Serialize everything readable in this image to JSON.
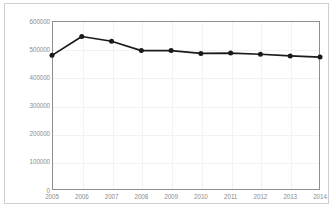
{
  "chart_data": {
    "type": "line",
    "title": "",
    "subtitle": "",
    "xlabel": "",
    "ylabel": "",
    "categories": [
      "2005",
      "2006",
      "2007",
      "2008",
      "2009",
      "2010",
      "2011",
      "2012",
      "2013",
      "2014"
    ],
    "x": [
      2005,
      2006,
      2007,
      2008,
      2009,
      2010,
      2011,
      2012,
      2013,
      2014
    ],
    "values": [
      478000,
      545000,
      528000,
      495000,
      495000,
      485000,
      486000,
      482000,
      476000,
      472000
    ],
    "series": [
      {
        "name": "",
        "values": [
          478000,
          545000,
          528000,
          495000,
          495000,
          485000,
          486000,
          482000,
          476000,
          472000
        ]
      }
    ],
    "ylim": [
      0,
      600000
    ],
    "yticks": [
      0,
      100000,
      200000,
      300000,
      400000,
      500000,
      600000
    ],
    "ytick_labels": [
      "0",
      "100000",
      "200000",
      "300000",
      "400000",
      "500000",
      "600000"
    ],
    "xtick_labels": [
      "2005",
      "2006",
      "2007",
      "2008",
      "2009",
      "2010",
      "2011",
      "2012",
      "2013",
      "2014"
    ],
    "grid": true,
    "legend": false,
    "legend_position": "none",
    "marker": "circle",
    "line_color": "#1a1a1a",
    "marker_color": "#1a1a1a",
    "grid_color": "#f2f2f2",
    "axis_color": "#8e8e8e",
    "tick_label_color": "#8c8c8c",
    "background": "#ffffff"
  },
  "figure": {
    "border_color": "#cfcfcf",
    "caption": ""
  }
}
